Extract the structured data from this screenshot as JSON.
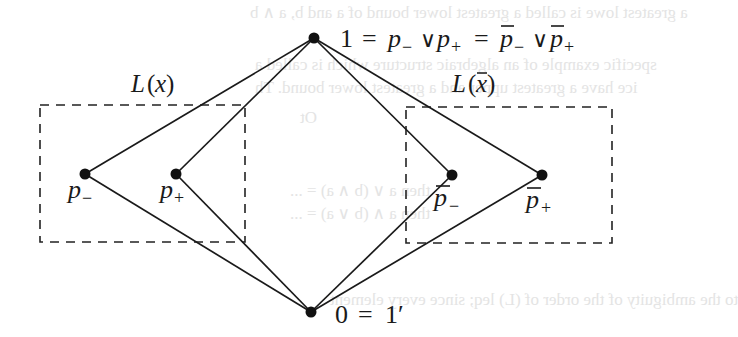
{
  "diagram": {
    "type": "lattice-hasse-diagram",
    "nodes": [
      {
        "id": "top",
        "label": "1 = p₋ ∨ p₊ = p̅₋ ∨ p̅₊",
        "x": 314,
        "y": 38
      },
      {
        "id": "p_minus",
        "label": "p₋",
        "x": 85,
        "y": 174
      },
      {
        "id": "p_plus",
        "label": "p₊",
        "x": 176,
        "y": 174
      },
      {
        "id": "pbar_minus",
        "label": "p̅₋",
        "x": 452,
        "y": 175
      },
      {
        "id": "pbar_plus",
        "label": "p̅₊",
        "x": 542,
        "y": 175
      },
      {
        "id": "bottom",
        "label": "0 = 1′",
        "x": 311,
        "y": 312
      }
    ],
    "edges": [
      [
        "top",
        "p_minus"
      ],
      [
        "top",
        "p_plus"
      ],
      [
        "top",
        "pbar_minus"
      ],
      [
        "top",
        "pbar_plus"
      ],
      [
        "bottom",
        "p_minus"
      ],
      [
        "bottom",
        "p_plus"
      ],
      [
        "bottom",
        "pbar_minus"
      ],
      [
        "bottom",
        "pbar_plus"
      ]
    ],
    "groups": [
      {
        "id": "L_x",
        "label": "L(x)",
        "box": {
          "x1": 40,
          "y1": 105,
          "x2": 245,
          "y2": 242
        },
        "members": [
          "p_minus",
          "p_plus"
        ]
      },
      {
        "id": "L_xbar",
        "label": "L(x̅)",
        "box": {
          "x1": 406,
          "y1": 107,
          "x2": 612,
          "y2": 243
        },
        "members": [
          "pbar_minus",
          "pbar_plus"
        ]
      }
    ],
    "labels": {
      "top": {
        "one": "1",
        "eq": "=",
        "p": "p",
        "minus": "−",
        "plus": "+",
        "or": "∨"
      },
      "bottom": {
        "zero": "0",
        "eq": "=",
        "one_prime": "1′"
      },
      "group_left": {
        "L": "L",
        "open": "(",
        "x": "x",
        "close": ")"
      },
      "group_right": {
        "L": "L",
        "open": "(",
        "x": "x",
        "close": ")"
      }
    }
  },
  "bleed_through": {
    "line1": "a greatest lowe is called a greatest lower bound of a and b, a ∧ b",
    "line2": "specific example of an algebraic structure which is called a",
    "line3": "ice have a greatest upper and a greatest lower bound. Th",
    "line4": "Ot",
    "line5": "then a ∨ (b ∧ a) = ...",
    "line6": "then a ∧ (b ∨ a) = ...",
    "line7": "to the ambiguity of the order of (L) leq; since every element"
  }
}
